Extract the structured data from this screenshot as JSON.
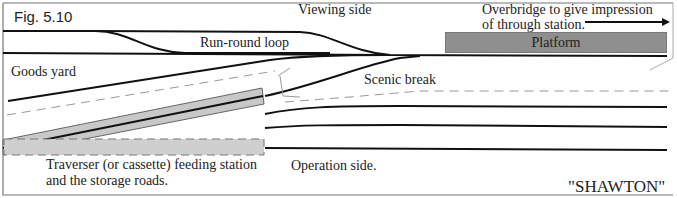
{
  "figure": {
    "number": "Fig. 5.10",
    "layout_name": "\"SHAWTON\""
  },
  "labels": {
    "viewing_side": "Viewing side",
    "overbridge_line1": "Overbridge to give impression",
    "overbridge_line2": "of through station.",
    "platform": "Platform",
    "run_round_loop": "Run-round loop",
    "goods_yard": "Goods yard",
    "scenic_break": "Scenic break",
    "traverser_line1": "Traverser (or cassette) feeding station",
    "traverser_line2": "and the storage roads.",
    "operation_side": "Operation side."
  },
  "colors": {
    "track": "#111111",
    "platform_fill": "#8f8f8f",
    "traverser_fill": "#c8c8c8",
    "dashed_line": "#999999",
    "border": "#777777"
  }
}
